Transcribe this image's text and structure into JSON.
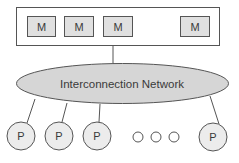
{
  "diagram": {
    "memory_bank": {
      "modules": [
        {
          "label": "M",
          "x": 27,
          "y": 16,
          "w": 28,
          "h": 20
        },
        {
          "label": "M",
          "x": 64,
          "y": 16,
          "w": 29,
          "h": 20
        },
        {
          "label": "M",
          "x": 103,
          "y": 16,
          "w": 29,
          "h": 20
        },
        {
          "label": "M",
          "x": 180,
          "y": 16,
          "w": 29,
          "h": 20
        }
      ]
    },
    "network": {
      "label": "Interconnection Network"
    },
    "processors": [
      {
        "label": "P",
        "cx": 21,
        "cy": 136
      },
      {
        "label": "P",
        "cx": 59,
        "cy": 136
      },
      {
        "label": "P",
        "cx": 97,
        "cy": 136
      },
      {
        "label": "P",
        "cx": 213,
        "cy": 137
      }
    ],
    "ellipsis_dots": 3,
    "colors": {
      "box_fill": "#e0e0e0",
      "ellipse_fill": "#d6d6d6",
      "circle_fill": "#ececec",
      "stroke": "#555555",
      "text": "#3a3a3a"
    }
  }
}
